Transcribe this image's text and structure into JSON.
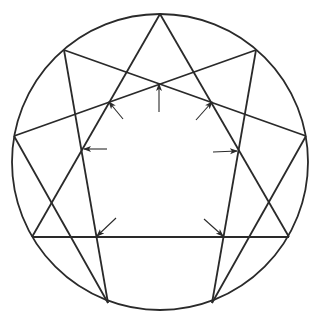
{
  "diagram": {
    "type": "enneagram-circle-with-inward-arrows",
    "stroke_color": "#2a2a2a",
    "background": "#ffffff",
    "circle": {
      "cx": 160,
      "cy": 162,
      "r": 148
    },
    "vertices": {
      "top": [
        160,
        14
      ],
      "upper_left": [
        64,
        50
      ],
      "upper_right": [
        256,
        50
      ],
      "left": [
        14,
        136
      ],
      "right": [
        306,
        136
      ],
      "lower_left": [
        32,
        237
      ],
      "lower_right": [
        289,
        237
      ],
      "bottom_left": [
        108,
        303
      ],
      "bottom_right": [
        212,
        303
      ]
    },
    "lines": [
      [
        "top",
        "lower_left"
      ],
      [
        "top",
        "lower_right"
      ],
      [
        "upper_left",
        "right"
      ],
      [
        "upper_left",
        "bottom_left"
      ],
      [
        "upper_right",
        "left"
      ],
      [
        "upper_right",
        "bottom_right"
      ],
      [
        "left",
        "bottom_left"
      ],
      [
        "right",
        "bottom_right"
      ],
      [
        "lower_left",
        "lower_right"
      ]
    ],
    "arrows": [
      {
        "name": "arrow-top",
        "tail": [
          159,
          112
        ],
        "tip": [
          159,
          84
        ]
      },
      {
        "name": "arrow-upper-left",
        "tail": [
          123,
          119
        ],
        "tip": [
          109,
          102
        ]
      },
      {
        "name": "arrow-upper-right",
        "tail": [
          196,
          120
        ],
        "tip": [
          212,
          102
        ]
      },
      {
        "name": "arrow-left",
        "tail": [
          107,
          149
        ],
        "tip": [
          84,
          149
        ]
      },
      {
        "name": "arrow-right",
        "tail": [
          213,
          152
        ],
        "tip": [
          237,
          151
        ]
      },
      {
        "name": "arrow-lower-left",
        "tail": [
          116,
          218
        ],
        "tip": [
          97,
          236
        ]
      },
      {
        "name": "arrow-lower-right",
        "tail": [
          204,
          219
        ],
        "tip": [
          223,
          236
        ]
      }
    ]
  }
}
